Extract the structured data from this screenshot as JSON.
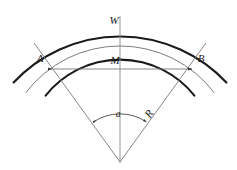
{
  "figure": {
    "background_color": "#ffffff",
    "stroke_color": "#1a1a1a",
    "thin_stroke_color": "#7a7a7a",
    "width_px": 237,
    "height_px": 170
  },
  "labels": {
    "width_label": "W",
    "left_point": "A",
    "midpoint": "M",
    "right_point": "B",
    "angle": "a",
    "radius": "R"
  },
  "geometry": {
    "apex_x": 120,
    "apex_y": 162,
    "outer_radius": 146,
    "middle_radius": 118,
    "inner_radius": 95,
    "angle_arc_radius": 48,
    "half_angle_deg": 33,
    "chord_y": 69,
    "chord_x_left": 48,
    "chord_x_right": 192
  },
  "elements": [
    {
      "name": "outer-arc",
      "type": "arc",
      "style": "thick"
    },
    {
      "name": "middle-arc",
      "type": "arc",
      "style": "thin"
    },
    {
      "name": "inner-arc",
      "type": "arc",
      "style": "thick"
    },
    {
      "name": "center-line",
      "type": "line",
      "style": "thin"
    },
    {
      "name": "left-radius-line",
      "type": "line",
      "style": "thin"
    },
    {
      "name": "right-radius-line",
      "type": "line",
      "style": "thin"
    },
    {
      "name": "chord-line",
      "type": "double-arrow",
      "style": "thin"
    },
    {
      "name": "angle-arc",
      "type": "double-arrow-arc",
      "style": "thin"
    }
  ]
}
